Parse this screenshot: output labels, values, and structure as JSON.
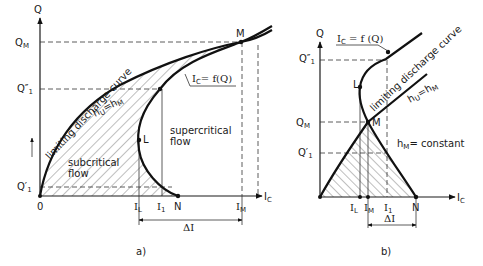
{
  "panel_a": {
    "caption": "a)",
    "y_axis_label": "Q",
    "x_axis_label": "I",
    "x_axis_label_sub": "C",
    "origin_label": "0",
    "y_ticks": [
      {
        "label": "Q",
        "sub": "M",
        "id": "QM"
      },
      {
        "label": "Q″",
        "sub": "1",
        "id": "Q1pp"
      },
      {
        "label": "Q′",
        "sub": "1",
        "id": "Q1p"
      }
    ],
    "x_ticks": [
      {
        "label": "I",
        "sub": "L",
        "id": "IL"
      },
      {
        "label": "I",
        "sub": "1",
        "id": "I1"
      },
      {
        "label": "N",
        "sub": "",
        "id": "N"
      },
      {
        "label": "I",
        "sub": "M",
        "id": "IM"
      }
    ],
    "points": {
      "M": "M",
      "L": "L"
    },
    "curve_labels": {
      "limiting": "limiting discharge curve",
      "hu_eq": "h",
      "hu_sub": "U",
      "hm_eq": "=h",
      "hm_sub": "M",
      "ic_func": "I",
      "ic_func_sub": "C",
      "ic_func_rest": "= f(Q)"
    },
    "regions": {
      "subcritical_1": "subcritical",
      "subcritical_2": "flow",
      "supercritical_1": "supercritical",
      "supercritical_2": "flow"
    },
    "delta": "ΔI"
  },
  "panel_b": {
    "caption": "b)",
    "y_axis_label": "Q",
    "x_axis_label": "I",
    "x_axis_label_sub": "C",
    "y_ticks": [
      {
        "label": "Q″",
        "sub": "1",
        "id": "Q1pp"
      },
      {
        "label": "Q",
        "sub": "M",
        "id": "QM"
      },
      {
        "label": "Q′",
        "sub": "1",
        "id": "Q1p"
      }
    ],
    "x_ticks": [
      {
        "label": "I",
        "sub": "L",
        "id": "IL"
      },
      {
        "label": "I",
        "sub": "M",
        "id": "IM"
      },
      {
        "label": "I",
        "sub": "1",
        "id": "I1"
      },
      {
        "label": "N",
        "sub": "",
        "id": "N"
      }
    ],
    "points": {
      "M": "M",
      "L": "L"
    },
    "curve_labels": {
      "limiting": "limiting discharge curve",
      "hu_eq": "h",
      "hu_sub": "U",
      "hm_eq": "=h",
      "hm_sub": "M",
      "ic_func": "I",
      "ic_func_sub": "C",
      "ic_func_rest": " = f (Q)",
      "constant": "h",
      "constant_sub": "M",
      "constant_rest": "= constant"
    },
    "delta": "ΔI"
  }
}
